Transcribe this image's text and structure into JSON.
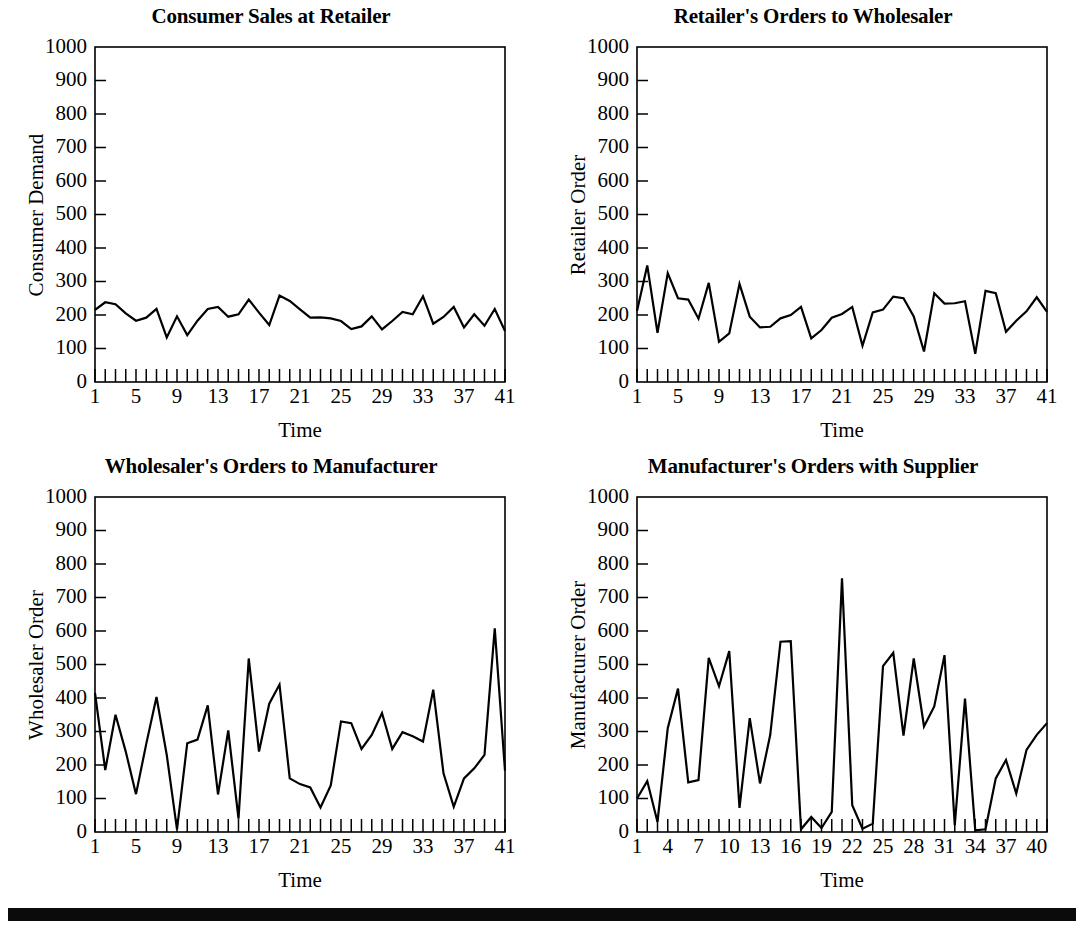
{
  "figure": {
    "background": "#ffffff",
    "line_color": "#000000",
    "axis_color": "#000000",
    "bottom_rule": true
  },
  "chart_data": [
    {
      "type": "line",
      "panel": "top-left",
      "title": "Consumer Sales at Retailer",
      "xlabel": "Time",
      "ylabel": "Consumer Demand",
      "ylim": [
        0,
        1000
      ],
      "xlim": [
        1,
        41
      ],
      "ytick_labels": [
        "0",
        "100",
        "200",
        "300",
        "400",
        "500",
        "600",
        "700",
        "800",
        "900",
        "1000"
      ],
      "ytick_values": [
        0,
        100,
        200,
        300,
        400,
        500,
        600,
        700,
        800,
        900,
        1000
      ],
      "xtick_labels": [
        "1",
        "5",
        "9",
        "13",
        "17",
        "21",
        "25",
        "29",
        "33",
        "37",
        "41"
      ],
      "xtick_values": [
        1,
        5,
        9,
        13,
        17,
        21,
        25,
        29,
        33,
        37,
        41
      ],
      "minor_xticks": 41,
      "grid": false,
      "legend": "none",
      "x": [
        1,
        2,
        3,
        4,
        5,
        6,
        7,
        8,
        9,
        10,
        11,
        12,
        13,
        14,
        15,
        16,
        17,
        18,
        19,
        20,
        21,
        22,
        23,
        24,
        25,
        26,
        27,
        28,
        29,
        30,
        31,
        32,
        33,
        34,
        35,
        36,
        37,
        38,
        39,
        40,
        41
      ],
      "values": [
        215,
        238,
        232,
        205,
        183,
        192,
        218,
        133,
        196,
        140,
        183,
        218,
        224,
        195,
        202,
        246,
        207,
        170,
        258,
        242,
        217,
        192,
        193,
        190,
        182,
        158,
        166,
        196,
        157,
        182,
        209,
        202,
        256,
        174,
        194,
        224,
        163,
        202,
        168,
        218,
        152
      ]
    },
    {
      "type": "line",
      "panel": "top-right",
      "title": "Retailer's Orders to Wholesaler",
      "xlabel": "Time",
      "ylabel": "Retailer Order",
      "ylim": [
        0,
        1000
      ],
      "xlim": [
        1,
        41
      ],
      "ytick_labels": [
        "0",
        "100",
        "200",
        "300",
        "400",
        "500",
        "600",
        "700",
        "800",
        "900",
        "1000"
      ],
      "ytick_values": [
        0,
        100,
        200,
        300,
        400,
        500,
        600,
        700,
        800,
        900,
        1000
      ],
      "xtick_labels": [
        "1",
        "5",
        "9",
        "13",
        "17",
        "21",
        "25",
        "29",
        "33",
        "37",
        "41"
      ],
      "xtick_values": [
        1,
        5,
        9,
        13,
        17,
        21,
        25,
        29,
        33,
        37,
        41
      ],
      "minor_xticks": 41,
      "grid": false,
      "legend": "none",
      "x": [
        1,
        2,
        3,
        4,
        5,
        6,
        7,
        8,
        9,
        10,
        11,
        12,
        13,
        14,
        15,
        16,
        17,
        18,
        19,
        20,
        21,
        22,
        23,
        24,
        25,
        26,
        27,
        28,
        29,
        30,
        31,
        32,
        33,
        34,
        35,
        36,
        37,
        38,
        39,
        40,
        41
      ],
      "values": [
        212,
        348,
        147,
        325,
        250,
        246,
        189,
        296,
        120,
        145,
        293,
        195,
        163,
        165,
        190,
        200,
        224,
        130,
        155,
        192,
        203,
        224,
        108,
        208,
        216,
        255,
        250,
        196,
        91,
        265,
        234,
        235,
        241,
        84,
        272,
        265,
        150,
        183,
        211,
        253,
        209
      ]
    },
    {
      "type": "line",
      "panel": "bottom-left",
      "title": "Wholesaler's Orders to Manufacturer",
      "xlabel": "Time",
      "ylabel": "Wholesaler Order",
      "ylim": [
        0,
        1000
      ],
      "xlim": [
        1,
        41
      ],
      "ytick_labels": [
        "0",
        "100",
        "200",
        "300",
        "400",
        "500",
        "600",
        "700",
        "800",
        "900",
        "1000"
      ],
      "ytick_values": [
        0,
        100,
        200,
        300,
        400,
        500,
        600,
        700,
        800,
        900,
        1000
      ],
      "xtick_labels": [
        "1",
        "5",
        "9",
        "13",
        "17",
        "21",
        "25",
        "29",
        "33",
        "37",
        "41"
      ],
      "xtick_values": [
        1,
        5,
        9,
        13,
        17,
        21,
        25,
        29,
        33,
        37,
        41
      ],
      "minor_xticks": 41,
      "grid": false,
      "legend": "none",
      "x": [
        1,
        2,
        3,
        4,
        5,
        6,
        7,
        8,
        9,
        10,
        11,
        12,
        13,
        14,
        15,
        16,
        17,
        18,
        19,
        20,
        21,
        22,
        23,
        24,
        25,
        26,
        27,
        28,
        29,
        30,
        31,
        32,
        33,
        34,
        35,
        36,
        37,
        38,
        39,
        40,
        41
      ],
      "values": [
        415,
        185,
        350,
        240,
        113,
        263,
        403,
        230,
        8,
        265,
        276,
        378,
        112,
        303,
        40,
        518,
        240,
        383,
        440,
        160,
        143,
        133,
        73,
        139,
        330,
        325,
        248,
        290,
        355,
        248,
        298,
        286,
        270,
        425,
        175,
        75,
        160,
        190,
        230,
        608,
        183
      ]
    },
    {
      "type": "line",
      "panel": "bottom-right",
      "title": "Manufacturer's Orders with Supplier",
      "xlabel": "Time",
      "ylabel": "Manufacturer Order",
      "ylim": [
        0,
        1000
      ],
      "xlim": [
        1,
        41
      ],
      "ytick_labels": [
        "0",
        "100",
        "200",
        "300",
        "400",
        "500",
        "600",
        "700",
        "800",
        "900",
        "1000"
      ],
      "ytick_values": [
        0,
        100,
        200,
        300,
        400,
        500,
        600,
        700,
        800,
        900,
        1000
      ],
      "xtick_labels": [
        "1",
        "4",
        "7",
        "10",
        "13",
        "16",
        "19",
        "22",
        "25",
        "28",
        "31",
        "34",
        "37",
        "40"
      ],
      "xtick_values": [
        1,
        4,
        7,
        10,
        13,
        16,
        19,
        22,
        25,
        28,
        31,
        34,
        37,
        40
      ],
      "minor_xticks": 41,
      "grid": false,
      "legend": "none",
      "x": [
        1,
        2,
        3,
        4,
        5,
        6,
        7,
        8,
        9,
        10,
        11,
        12,
        13,
        14,
        15,
        16,
        17,
        18,
        19,
        20,
        21,
        22,
        23,
        24,
        25,
        26,
        27,
        28,
        29,
        30,
        31,
        32,
        33,
        34,
        35,
        36,
        37,
        38,
        39,
        40,
        41
      ],
      "values": [
        100,
        152,
        30,
        310,
        428,
        148,
        155,
        520,
        435,
        540,
        72,
        340,
        145,
        290,
        568,
        570,
        8,
        45,
        12,
        60,
        757,
        80,
        10,
        25,
        495,
        535,
        288,
        518,
        315,
        375,
        528,
        20,
        398,
        5,
        8,
        160,
        215,
        115,
        245,
        290,
        325
      ]
    }
  ]
}
